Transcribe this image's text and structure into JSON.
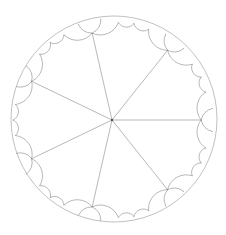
{
  "figure": {
    "title": "Hyperbolic {3,7} triangle tiling in the Poincaré disk",
    "type": "poincare-disk-tiling",
    "schlafli": [
      3,
      7
    ],
    "disk": {
      "cx": 114,
      "cy": 119,
      "r": 103
    },
    "rotation_deg": 0,
    "center_vertex_offset": {
      "x": -2,
      "y": 1
    },
    "max_depth": 7,
    "colors": {
      "background": "#ffffff",
      "edge": "#9a9a9a",
      "vertex": "#555555",
      "boundary": "#b0b0b0"
    },
    "edge_width": 0.7,
    "vertex_radius": 1.0
  }
}
